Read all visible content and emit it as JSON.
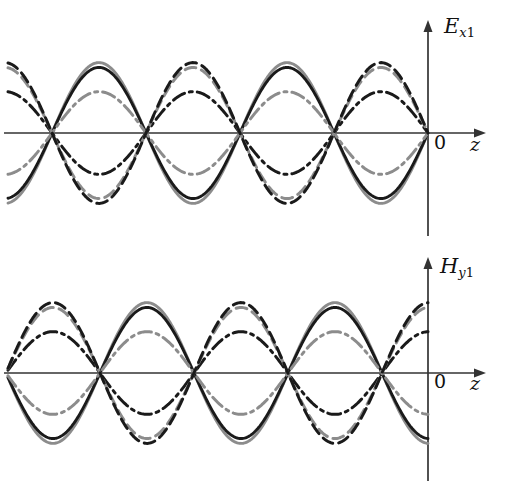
{
  "figure": {
    "title": "",
    "background": "#ffffff",
    "width": 508,
    "height": 487
  },
  "panels": [
    {
      "id": "E",
      "axis_label": "E",
      "axis_sub_italic": "x",
      "axis_sub_num": "1",
      "origin_label": "0",
      "abscissa_label": "z"
    },
    {
      "id": "H",
      "axis_label": "H",
      "axis_sub_italic": "y",
      "axis_sub_num": "1",
      "origin_label": "0",
      "abscissa_label": "z"
    }
  ],
  "colors": {
    "black": "#1a1a1a",
    "gray": "#8c8c8c",
    "axis": "#333333"
  },
  "chart_data": {
    "type": "line",
    "title": "",
    "xlabel": "z",
    "ylabel": "",
    "grid": false,
    "legend": "none",
    "subplots": [
      {
        "name": "E_x1",
        "ylabel": "E_x1",
        "xlabel": "z",
        "axis_y_px": 133,
        "x_start": 8,
        "x_end": 428,
        "node_positions_px": [
          52,
          146,
          240,
          334,
          428
        ],
        "half_period_px": 94,
        "xlim": [
          -4.47,
          0
        ],
        "ylim": [
          -1.05,
          1.05
        ],
        "series": [
          {
            "name": "phase-1-solid-black",
            "style": "solid",
            "color": "#1a1a1a",
            "amplitude": 0.745,
            "phase_sign": 1,
            "peak_px": 63
          },
          {
            "name": "phase-2-solid-gray",
            "style": "solid",
            "color": "#8c8c8c",
            "amplitude": 0.8,
            "phase_sign": 1,
            "peak_px": 58
          },
          {
            "name": "phase-3-dashdot-gray",
            "style": "dashdot",
            "color": "#8c8c8c",
            "amplitude": 0.47,
            "phase_sign": 1,
            "peak_px": 92
          },
          {
            "name": "phase-4-dashdot-black",
            "style": "dashdot",
            "color": "#1a1a1a",
            "amplitude": 0.47,
            "phase_sign": -1,
            "peak_px": 163
          },
          {
            "name": "phase-5-dashed-gray",
            "style": "dashed",
            "color": "#8c8c8c",
            "amplitude": 0.745,
            "phase_sign": -1,
            "peak_px": 192
          },
          {
            "name": "phase-6-dashed-black",
            "style": "dashed",
            "color": "#1a1a1a",
            "amplitude": 0.8,
            "phase_sign": -1,
            "peak_px": 203
          }
        ]
      },
      {
        "name": "H_y1",
        "ylabel": "H_y1",
        "xlabel": "z",
        "axis_y_px": 130,
        "x_start": 8,
        "x_end": 428,
        "node_positions_px": [
          100,
          194,
          288,
          382
        ],
        "half_period_px": 94,
        "xlim": [
          -4.47,
          0
        ],
        "ylim": [
          -1.05,
          1.05
        ],
        "series": [
          {
            "name": "phase-1-solid-black",
            "style": "solid",
            "color": "#1a1a1a",
            "amplitude": 0.745,
            "phase_sign": 1,
            "peak_px": 60
          },
          {
            "name": "phase-2-solid-gray",
            "style": "solid",
            "color": "#8c8c8c",
            "amplitude": 0.8,
            "phase_sign": 1,
            "peak_px": 55
          },
          {
            "name": "phase-3-dashdot-gray",
            "style": "dashdot",
            "color": "#8c8c8c",
            "amplitude": 0.47,
            "phase_sign": 1,
            "peak_px": 89
          },
          {
            "name": "phase-4-dashdot-black",
            "style": "dashdot",
            "color": "#1a1a1a",
            "amplitude": 0.47,
            "phase_sign": -1,
            "peak_px": 160
          },
          {
            "name": "phase-5-dashed-gray",
            "style": "dashed",
            "color": "#8c8c8c",
            "amplitude": 0.745,
            "phase_sign": -1,
            "peak_px": 189
          },
          {
            "name": "phase-6-dashed-black",
            "style": "dashed",
            "color": "#1a1a1a",
            "amplitude": 0.8,
            "phase_sign": -1,
            "peak_px": 200
          }
        ]
      }
    ]
  }
}
